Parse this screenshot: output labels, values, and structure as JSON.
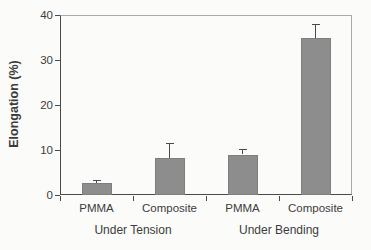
{
  "chart_data": {
    "type": "bar",
    "title": "",
    "xlabel": "",
    "ylabel": "Elongation (%)",
    "ylim": [
      0,
      40
    ],
    "yticks": [
      "0",
      "10",
      "20",
      "30",
      "40"
    ],
    "categories": [
      "PMMA",
      "Composite",
      "PMMA",
      "Composite"
    ],
    "group_labels": [
      "Under Tension",
      "Under Bending"
    ],
    "values": [
      2.7,
      8.3,
      9.0,
      35.0
    ],
    "errors": [
      0.6,
      3.3,
      1.3,
      3.0
    ],
    "grid": false,
    "legend": "none",
    "colors": {
      "bar_fill": "#8d8d8d",
      "bar_edge": "#7e7e7e",
      "axis": "#4a4a4a",
      "frame_light": "#aaaaaa",
      "error_bar": "#4a4a4a",
      "text": "#3b3b3b",
      "background": "#fbfbfa"
    }
  }
}
